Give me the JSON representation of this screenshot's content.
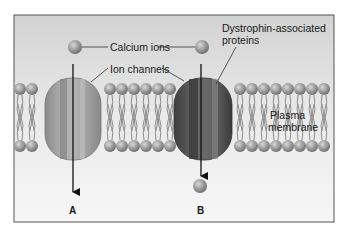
{
  "labels": {
    "calcium_ions": "Calcium ions",
    "ion_channels": "Ion channels",
    "dystrophin_line1": "Dystrophin-associated",
    "dystrophin_line2": "proteins",
    "plasma_line1": "Plasma",
    "plasma_line2": "membrane",
    "panel_a": "A",
    "panel_b": "B"
  },
  "colors": {
    "background_top": "#d4d4d4",
    "background_bottom": "#f6f6f6",
    "frame": "#555555",
    "head": "#9a9a9a",
    "channel_a": "#9c9c9c",
    "channel_b": "#5a5a5a",
    "arrow": "#111111"
  }
}
